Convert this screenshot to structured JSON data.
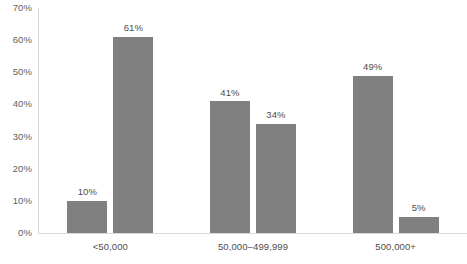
{
  "chart_data": {
    "type": "bar",
    "title": "",
    "subtitle": "",
    "xlabel": "",
    "ylabel": "",
    "categories": [
      "<50,000",
      "50,000–499,999",
      "500,000+"
    ],
    "series": [
      {
        "name": "Series 1",
        "values": [
          10,
          41,
          49
        ],
        "color": "#808080"
      },
      {
        "name": "Series 2",
        "values": [
          61,
          34,
          5
        ],
        "color": "#808080"
      }
    ],
    "data_labels": [
      [
        "10%",
        "41%",
        "49%"
      ],
      [
        "61%",
        "34%",
        "5%"
      ]
    ],
    "ylim": [
      0,
      70
    ],
    "ytick_values": [
      0,
      10,
      20,
      30,
      40,
      50,
      60,
      70
    ],
    "ytick_labels": [
      "0%",
      "10%",
      "20%",
      "30%",
      "40%",
      "50%",
      "60%",
      "70%"
    ],
    "grid": false,
    "legend": false,
    "legend_position": "none",
    "axis_color": "#d9d9d9",
    "text_color": "#595959",
    "background": "#ffffff"
  }
}
